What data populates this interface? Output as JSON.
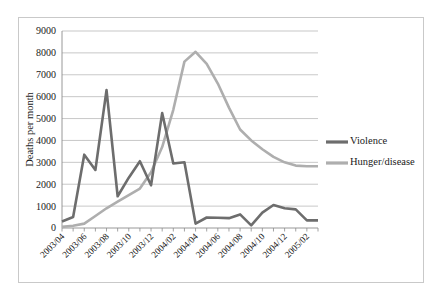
{
  "chart_data": {
    "type": "line",
    "title": "",
    "xlabel": "",
    "ylabel": "Deaths per month",
    "ylim": [
      0,
      9000
    ],
    "ytick_step": 1000,
    "yticks": [
      "0",
      "1000",
      "2000",
      "3000",
      "4000",
      "5000",
      "6000",
      "7000",
      "8000",
      "9000"
    ],
    "grid": "horizontal",
    "legend_position": "right",
    "x": [
      "2003/04",
      "2003/05",
      "2003/06",
      "2003/07",
      "2003/08",
      "2003/09",
      "2003/10",
      "2003/11",
      "2003/12",
      "2004/01",
      "2004/02",
      "2004/03",
      "2004/04",
      "2004/05",
      "2004/06",
      "2004/07",
      "2004/08",
      "2004/09",
      "2004/10",
      "2004/11",
      "2004/12",
      "2005/01",
      "2005/02",
      "2005/03"
    ],
    "xtick_labels": [
      "2003/04",
      "2003/06",
      "2003/08",
      "2003/10",
      "2003/12",
      "2004/02",
      "2004/04",
      "2004/06",
      "2004/08",
      "2004/10",
      "2004/12",
      "2005/02"
    ],
    "series": [
      {
        "name": "Violence",
        "color": "#6d6d6d",
        "values": [
          300,
          500,
          3350,
          2650,
          6300,
          1450,
          2300,
          3050,
          1950,
          5250,
          2950,
          3000,
          200,
          480,
          470,
          450,
          620,
          120,
          700,
          1050,
          900,
          850,
          350,
          350
        ]
      },
      {
        "name": "Hunger/disease",
        "color": "#aeaeae",
        "values": [
          50,
          100,
          200,
          550,
          900,
          1200,
          1500,
          1800,
          2550,
          3700,
          5400,
          7600,
          8050,
          7500,
          6600,
          5500,
          4500,
          4000,
          3600,
          3250,
          3000,
          2850,
          2820,
          2820
        ]
      }
    ]
  },
  "legend": {
    "items": [
      {
        "label": "Violence",
        "color": "#6d6d6d"
      },
      {
        "label": "Hunger/disease",
        "color": "#aeaeae"
      }
    ]
  }
}
